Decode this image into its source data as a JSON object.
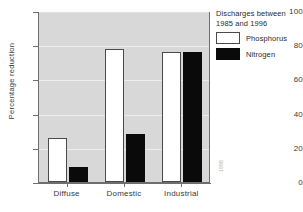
{
  "chart_data": {
    "type": "bar",
    "title": "",
    "subtitle": "",
    "xlabel": "",
    "ylabel": "Percentage reduction",
    "categories": [
      "Diffuse",
      "Domestic",
      "Industrial"
    ],
    "series": [
      {
        "name": "Phosphorus",
        "values": [
          26,
          78,
          76
        ],
        "color": "#ffffff"
      },
      {
        "name": "Nitrogen",
        "values": [
          9,
          28,
          76
        ],
        "color": "#0a0a0a"
      }
    ],
    "ylim": [
      0,
      100
    ],
    "yticks": [
      0,
      20,
      40,
      60,
      80,
      100
    ],
    "ytick_labels": [
      "0",
      "20",
      "40",
      "60",
      "80",
      "100"
    ],
    "grid": true,
    "legend_position": "top-right",
    "legend_title": "Discharges between 1985 and 1996",
    "plot_background": "#d8d8d8",
    "axis_color": "#6e6e6e"
  },
  "legend": {
    "title": "Discharges between 1985 and 1996",
    "entries": [
      {
        "label": "Phosphorus"
      },
      {
        "label": "Nitrogen"
      }
    ]
  },
  "axes": {
    "y_title": "Percentage reduction",
    "y_ticks": [
      "100",
      "80",
      "60",
      "40",
      "20",
      "0"
    ],
    "x_categories": [
      "Diffuse",
      "Domestic",
      "Industrial"
    ]
  },
  "watermark": {
    "text": "1998"
  }
}
